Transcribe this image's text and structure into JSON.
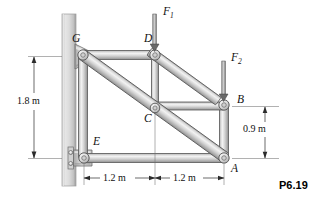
{
  "figure": {
    "id_label": "P6.19"
  },
  "colors": {
    "member_light": "#e9e9e9",
    "member_mid": "#bdbdbd",
    "member_dark": "#8c8c8c",
    "member_outline": "#5a5a5a",
    "wall_light": "#e3e3e3",
    "wall_mid": "#c9c9c9",
    "wall_dark": "#a8a8a8",
    "pin_ring": "#6f6f6f",
    "line": "#2b2b2b",
    "text": "#111111"
  },
  "joints": [
    {
      "name": "G",
      "label": "G",
      "x": 83,
      "y": 55,
      "label_x": 72,
      "label_y": 33
    },
    {
      "name": "D",
      "label": "D",
      "x": 155,
      "y": 55,
      "label_x": 144,
      "label_y": 33
    },
    {
      "name": "C",
      "label": "C",
      "x": 155,
      "y": 108,
      "label_x": 144,
      "label_y": 113
    },
    {
      "name": "B",
      "label": "B",
      "x": 224,
      "y": 105,
      "label_x": 237,
      "label_y": 94
    },
    {
      "name": "A",
      "label": "A",
      "x": 224,
      "y": 158,
      "label_x": 231,
      "label_y": 163
    },
    {
      "name": "E",
      "label": "E",
      "x": 84,
      "y": 158,
      "label_x": 93,
      "label_y": 136
    }
  ],
  "members": [
    {
      "name": "member-G-D",
      "from": "G",
      "to": "D"
    },
    {
      "name": "member-D-B",
      "from": "D",
      "to": "B"
    },
    {
      "name": "member-D-C",
      "from": "D",
      "to": "C"
    },
    {
      "name": "member-C-B",
      "from": "C",
      "to": "B"
    },
    {
      "name": "member-G-A",
      "from": "G",
      "to": "A"
    },
    {
      "name": "member-G-E",
      "from": "G",
      "to": "E"
    },
    {
      "name": "member-E-A",
      "from": "E",
      "to": "A"
    },
    {
      "name": "member-B-A",
      "from": "B",
      "to": "A"
    }
  ],
  "forces": [
    {
      "name": "force-F1",
      "label": "F",
      "subscript": "1",
      "at_joint": "D",
      "direction": "down",
      "label_x": 163,
      "label_y": 6,
      "arrow_x": 155,
      "arrow_from_y": 14,
      "arrow_to_y": 50
    },
    {
      "name": "force-F2",
      "label": "F",
      "subscript": "2",
      "at_joint": "B",
      "direction": "down",
      "label_x": 231,
      "label_y": 52,
      "arrow_x": 224,
      "arrow_from_y": 61,
      "arrow_to_y": 100
    }
  ],
  "dimensions": [
    {
      "name": "dimension-height-1-8m",
      "value": "1.8 m",
      "orientation": "vertical",
      "label_x": 17,
      "label_y": 101,
      "line_x": 34,
      "from": 57,
      "to": 158
    },
    {
      "name": "dimension-height-0-9m",
      "value": "0.9 m",
      "orientation": "vertical",
      "label_x": 250,
      "label_y": 129,
      "line_x": 265,
      "from": 107,
      "to": 158
    },
    {
      "name": "dimension-span-left-1-2m",
      "value": "1.2 m",
      "orientation": "horizontal",
      "label_x": 106,
      "label_y": 173,
      "line_y": 178,
      "from": 84,
      "to": 155
    },
    {
      "name": "dimension-span-right-1-2m",
      "value": "1.2 m",
      "orientation": "horizontal",
      "label_x": 176,
      "label_y": 173,
      "line_y": 178,
      "from": 155,
      "to": 224
    }
  ],
  "wall": {
    "name": "support-wall",
    "x": 62,
    "y": 14,
    "width": 14,
    "height": 172
  },
  "supports": [
    {
      "name": "support-gusset-top",
      "at_joint": "G",
      "type": "tapered-gusset"
    },
    {
      "name": "support-bracket-bottom",
      "at_joint": "E",
      "type": "bolted-plate",
      "bolt_count": 2
    }
  ]
}
